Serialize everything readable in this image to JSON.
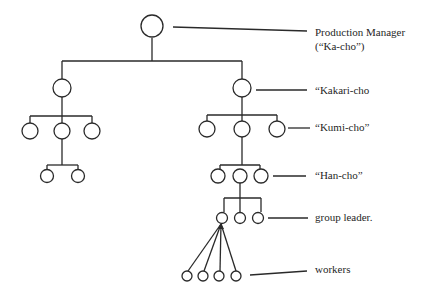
{
  "diagram": {
    "type": "organization-hierarchy",
    "line_color": "#2a2a2a",
    "labels": {
      "production_manager": "Production Manager",
      "production_manager_jp": "(“Ka-cho”)",
      "kakari_cho": "“Kakari-cho",
      "kumi_cho": "“Kumi-cho”",
      "han_cho": "“Han-cho”",
      "group_leader": "group leader.",
      "workers": "workers"
    },
    "levels": [
      {
        "name": "Production Manager (Ka-cho)",
        "count": 1
      },
      {
        "name": "Kakari-cho",
        "count": 2
      },
      {
        "name": "Kumi-cho",
        "count": 6
      },
      {
        "name": "Han-cho",
        "count": 5
      },
      {
        "name": "group leader",
        "count": 3
      },
      {
        "name": "workers",
        "count": 4
      }
    ]
  }
}
